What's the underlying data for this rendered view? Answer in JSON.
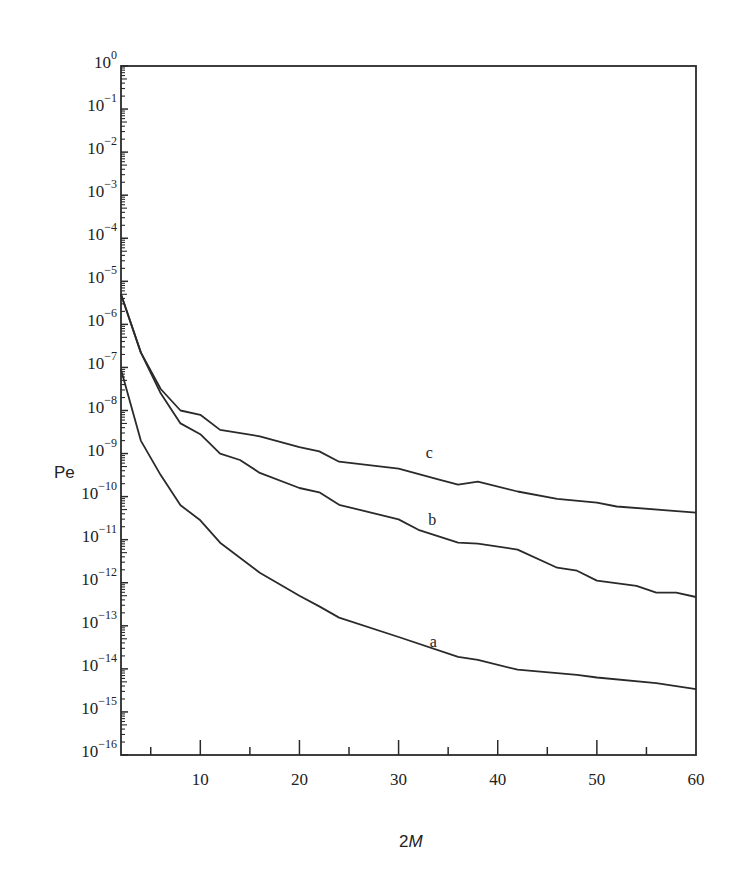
{
  "chart_data": {
    "type": "line",
    "title": "",
    "xlabel": "2M",
    "ylabel": "Pe",
    "xscale": "linear",
    "yscale": "log",
    "xlim": [
      2,
      60
    ],
    "ylim": [
      1e-16,
      1
    ],
    "xticks": [
      10,
      20,
      30,
      40,
      50,
      60
    ],
    "xticks_minor": [
      5,
      15,
      25,
      35,
      45,
      55
    ],
    "yticks_exponents": [
      0,
      -1,
      -2,
      -3,
      -4,
      -5,
      -6,
      -7,
      -8,
      -9,
      -10,
      -11,
      -12,
      -13,
      -14,
      -15,
      -16
    ],
    "grid": false,
    "legend": "inline labels a, b, c",
    "series": [
      {
        "name": "a",
        "label_pos": {
          "x": 33.5,
          "log10_y": -13.5
        },
        "x": [
          2,
          4,
          6,
          8,
          10,
          12,
          16,
          20,
          22,
          24,
          30,
          36,
          38,
          42,
          48,
          50,
          56,
          60
        ],
        "log10_values": [
          -7.05,
          -8.7,
          -9.5,
          -10.2,
          -10.55,
          -11.07,
          -11.77,
          -12.3,
          -12.55,
          -12.81,
          -13.26,
          -13.72,
          -13.79,
          -14.02,
          -14.14,
          -14.2,
          -14.33,
          -14.47
        ]
      },
      {
        "name": "b",
        "label_pos": {
          "x": 33.4,
          "log10_y": -10.65
        },
        "x": [
          2,
          4,
          6,
          8,
          10,
          12,
          14,
          16,
          20,
          22,
          24,
          30,
          32,
          36,
          38,
          42,
          46,
          48,
          50,
          54,
          56,
          58,
          60
        ],
        "log10_values": [
          -5.3,
          -6.65,
          -7.6,
          -8.3,
          -8.55,
          -9.0,
          -9.15,
          -9.45,
          -9.8,
          -9.9,
          -10.19,
          -10.53,
          -10.77,
          -11.07,
          -11.09,
          -11.23,
          -11.65,
          -11.72,
          -11.95,
          -12.07,
          -12.23,
          -12.23,
          -12.33
        ]
      },
      {
        "name": "c",
        "label_pos": {
          "x": 33.1,
          "log10_y": -9.1
        },
        "x": [
          2,
          4,
          6,
          8,
          10,
          12,
          16,
          20,
          22,
          24,
          30,
          34,
          36,
          38,
          42,
          46,
          50,
          52,
          60
        ],
        "log10_values": [
          -5.3,
          -6.65,
          -7.5,
          -8.0,
          -8.1,
          -8.45,
          -8.6,
          -8.85,
          -8.95,
          -9.19,
          -9.35,
          -9.6,
          -9.72,
          -9.65,
          -9.88,
          -10.05,
          -10.14,
          -10.23,
          -10.37
        ]
      }
    ]
  },
  "labels": {
    "y_axis": "Pe",
    "x_axis_prefix": "2",
    "x_axis_var": "M",
    "tick_base": "10"
  }
}
